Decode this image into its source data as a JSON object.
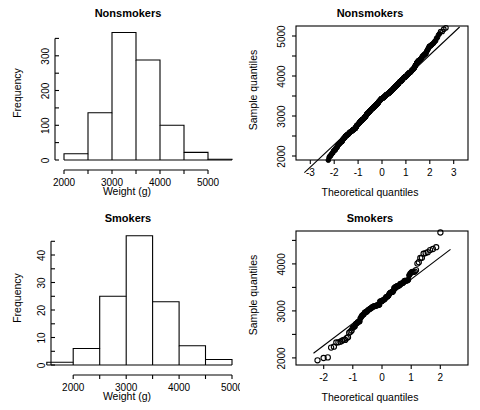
{
  "figure": {
    "width": 480,
    "height": 410,
    "background": "#ffffff",
    "foreground": "#000000",
    "layout": "2x2"
  },
  "chart_data": [
    {
      "id": "nonsmokers-histogram",
      "type": "bar",
      "subtype": "histogram",
      "title": "Nonsmokers",
      "xlabel": "Weight (g)",
      "ylabel": "Frequency",
      "bin_width": 500,
      "bin_edges": [
        2000,
        2500,
        3000,
        3500,
        4000,
        4500,
        5000,
        5500
      ],
      "categories": [
        "2000-2500",
        "2500-3000",
        "3000-3500",
        "3500-4000",
        "4000-4500",
        "4500-5000",
        "5000-5500"
      ],
      "values": [
        18,
        136,
        367,
        288,
        100,
        22,
        2
      ],
      "xlim": [
        2000,
        5500
      ],
      "ylim": [
        0,
        380
      ],
      "xticks": [
        2000,
        3000,
        4000,
        5000
      ],
      "xticklabels": [
        "2000",
        "3000",
        "4000",
        "5000"
      ],
      "xminorticks": [
        2500,
        3500,
        4500
      ],
      "yticks": [
        0,
        100,
        200,
        300
      ],
      "yticklabels": [
        "0",
        "100",
        "200",
        "300"
      ],
      "yminorticks": [
        50,
        150,
        250,
        350
      ],
      "grid": false,
      "legend": "none"
    },
    {
      "id": "nonsmokers-qqplot",
      "type": "scatter",
      "subtype": "qq-plot",
      "title": "Nonsmokers",
      "xlabel": "Theoretical quantiles",
      "ylabel": "Sample quantiles",
      "xlim": [
        -3.6,
        3.6
      ],
      "ylim": [
        1900,
        5250
      ],
      "xticks": [
        -3,
        -2,
        -1,
        0,
        1,
        2,
        3
      ],
      "xticklabels": [
        "-3",
        "-2",
        "-1",
        "0",
        "1",
        "2",
        "3"
      ],
      "yticks": [
        2000,
        3000,
        4000,
        5000
      ],
      "yticklabels": [
        "2000",
        "3000",
        "4000",
        "5000"
      ],
      "yminorticks": [
        2500,
        3500,
        4500
      ],
      "reference_line": {
        "intercept": 3405,
        "slope": 560
      },
      "n_points": 933,
      "grid": false,
      "legend": "none",
      "frame": true
    },
    {
      "id": "smokers-histogram",
      "type": "bar",
      "subtype": "histogram",
      "title": "Smokers",
      "xlabel": "Weight (g)",
      "ylabel": "Frequency",
      "bin_width": 500,
      "bin_edges": [
        1500,
        2000,
        2500,
        3000,
        3500,
        4000,
        4500,
        5000
      ],
      "categories": [
        "1500-2000",
        "2000-2500",
        "2500-3000",
        "3000-3500",
        "3500-4000",
        "4000-4500",
        "4500-5000"
      ],
      "values": [
        1,
        6,
        25,
        47,
        23,
        7,
        2
      ],
      "xlim": [
        1750,
        5000
      ],
      "ylim": [
        0,
        48
      ],
      "xticks": [
        2000,
        3000,
        4000,
        5000
      ],
      "xticklabels": [
        "2000",
        "3000",
        "4000",
        "5000"
      ],
      "xminorticks": [
        2500,
        3500,
        4500
      ],
      "yticks": [
        0,
        10,
        20,
        30,
        40
      ],
      "yticklabels": [
        "0",
        "10",
        "20",
        "30",
        "40"
      ],
      "yminorticks": [
        5,
        15,
        25,
        35,
        45
      ],
      "grid": false,
      "legend": "none"
    },
    {
      "id": "smokers-qqplot",
      "type": "scatter",
      "subtype": "qq-plot",
      "title": "Smokers",
      "xlabel": "Theoretical quantiles",
      "ylabel": "Sample quantiles",
      "xlim": [
        -2.95,
        2.95
      ],
      "ylim": [
        1850,
        4700
      ],
      "xticks": [
        -2,
        -1,
        0,
        1,
        2
      ],
      "xticklabels": [
        "-2",
        "-1",
        "0",
        "1",
        "2"
      ],
      "yticks": [
        2000,
        3000,
        4000
      ],
      "yticklabels": [
        "2000",
        "3000",
        "4000"
      ],
      "yminorticks": [
        2500,
        3500,
        4500
      ],
      "reference_line": {
        "intercept": 3205,
        "slope": 470
      },
      "n_points": 111,
      "grid": false,
      "legend": "none",
      "frame": true
    }
  ],
  "panels": {
    "top_left": {
      "title": "Nonsmokers",
      "xlabel": "Weight (g)",
      "ylabel": "Frequency"
    },
    "top_right": {
      "title": "Nonsmokers",
      "xlabel": "Theoretical quantiles",
      "ylabel": "Sample quantiles"
    },
    "bottom_left": {
      "title": "Smokers",
      "xlabel": "Weight (g)",
      "ylabel": "Frequency"
    },
    "bottom_right": {
      "title": "Smokers",
      "xlabel": "Theoretical quantiles",
      "ylabel": "Sample quantiles"
    }
  }
}
